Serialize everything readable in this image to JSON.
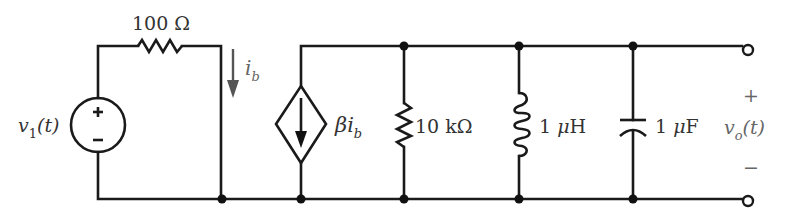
{
  "diagram": {
    "type": "circuit-schematic",
    "colors": {
      "wire": "#1a1a1a",
      "label": "#333333",
      "output_label": "#666666",
      "background": "#ffffff"
    },
    "source": {
      "name": "v",
      "subscript": "1",
      "arg": "(t)",
      "plus": "+",
      "minus": "−"
    },
    "series_resistor": {
      "label": "100 Ω"
    },
    "current_label": {
      "symbol": "i",
      "subscript": "b"
    },
    "dependent_source": {
      "coefficient": "β",
      "symbol": "i",
      "subscript": "b"
    },
    "shunt_resistor": {
      "label": "10 kΩ"
    },
    "inductor": {
      "label_num": "1 ",
      "label_mu": "μ",
      "label_unit": "H"
    },
    "capacitor": {
      "label_num": "1 ",
      "label_mu": "μ",
      "label_unit": "F"
    },
    "output": {
      "name": "v",
      "subscript": "o",
      "arg": "(t)",
      "plus": "+",
      "minus": "−"
    }
  }
}
